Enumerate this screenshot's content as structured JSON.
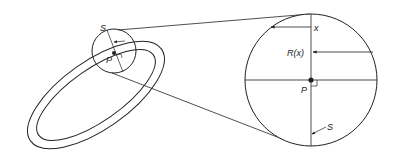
{
  "figure": {
    "type": "diagram",
    "labels": {
      "small_S": "S",
      "small_P": "P",
      "big_x": "x",
      "big_Rx": "R(x)",
      "big_P": "P",
      "big_S": "S"
    },
    "colors": {
      "stroke": "#222222",
      "background": "#ffffff"
    }
  }
}
